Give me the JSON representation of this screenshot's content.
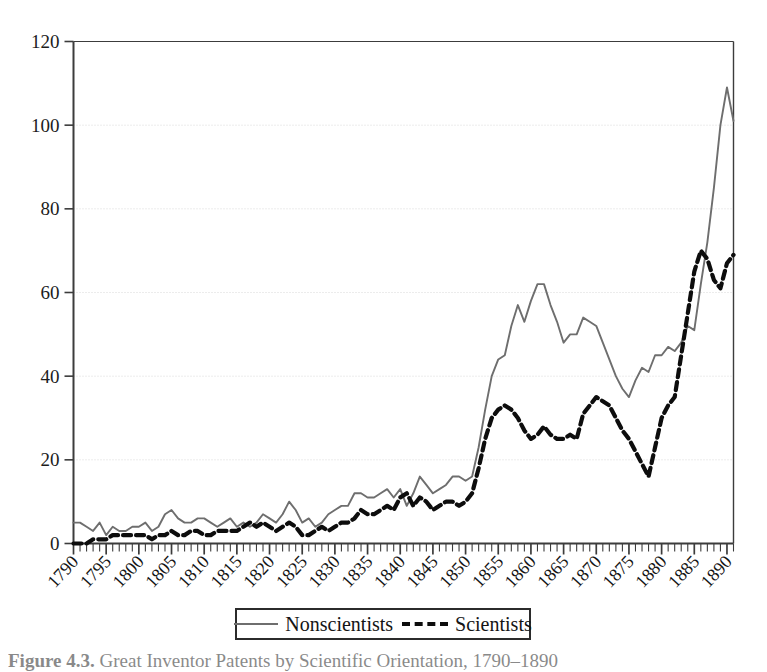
{
  "figure": {
    "caption_prefix": "Figure 4.3.",
    "caption_text": "Great Inventor Patents by Scientific Orientation, 1790–1890"
  },
  "legend": {
    "nonscientists_label": "Nonscientists",
    "scientists_label": "Scientists",
    "nonscientists_style": "solid",
    "scientists_style": "dashed"
  },
  "axes": {
    "y_ticks": [
      0,
      20,
      40,
      60,
      80,
      100,
      120
    ],
    "x_ticks": [
      1790,
      1795,
      1800,
      1805,
      1810,
      1815,
      1820,
      1825,
      1830,
      1835,
      1840,
      1845,
      1850,
      1855,
      1860,
      1865,
      1870,
      1875,
      1880,
      1885,
      1890
    ]
  },
  "colors": {
    "nonscientists": "#6e6e6e",
    "scientists": "#0d0d0d",
    "axis": "#3c3c3c",
    "gridline": "#d8d8d8",
    "background": "#ffffff"
  },
  "chart_data": {
    "type": "line",
    "title": "Great Inventor Patents by Scientific Orientation, 1790–1890",
    "xlabel": "",
    "ylabel": "",
    "xlim": [
      1790,
      1891
    ],
    "ylim": [
      0,
      120
    ],
    "grid": true,
    "legend_position": "bottom",
    "x": [
      1790,
      1791,
      1792,
      1793,
      1794,
      1795,
      1796,
      1797,
      1798,
      1799,
      1800,
      1801,
      1802,
      1803,
      1804,
      1805,
      1806,
      1807,
      1808,
      1809,
      1810,
      1811,
      1812,
      1813,
      1814,
      1815,
      1816,
      1817,
      1818,
      1819,
      1820,
      1821,
      1822,
      1823,
      1824,
      1825,
      1826,
      1827,
      1828,
      1829,
      1830,
      1831,
      1832,
      1833,
      1834,
      1835,
      1836,
      1837,
      1838,
      1839,
      1840,
      1841,
      1842,
      1843,
      1844,
      1845,
      1846,
      1847,
      1848,
      1849,
      1850,
      1851,
      1852,
      1853,
      1854,
      1855,
      1856,
      1857,
      1858,
      1859,
      1860,
      1861,
      1862,
      1863,
      1864,
      1865,
      1866,
      1867,
      1868,
      1869,
      1870,
      1871,
      1872,
      1873,
      1874,
      1875,
      1876,
      1877,
      1878,
      1879,
      1880,
      1881,
      1882,
      1883,
      1884,
      1885,
      1886,
      1887,
      1888,
      1889,
      1890,
      1891
    ],
    "series": [
      {
        "name": "Nonscientists",
        "style": "solid",
        "color": "#6e6e6e",
        "values": [
          5,
          5,
          4,
          3,
          5,
          2,
          4,
          3,
          3,
          4,
          4,
          5,
          3,
          4,
          7,
          8,
          6,
          5,
          5,
          6,
          6,
          5,
          4,
          5,
          6,
          4,
          5,
          4,
          5,
          7,
          6,
          5,
          7,
          10,
          8,
          5,
          6,
          4,
          5,
          7,
          8,
          9,
          9,
          12,
          12,
          11,
          11,
          12,
          13,
          11,
          13,
          9,
          12,
          16,
          14,
          12,
          13,
          14,
          16,
          16,
          15,
          16,
          23,
          32,
          40,
          44,
          45,
          52,
          57,
          53,
          58,
          62,
          62,
          57,
          53,
          48,
          50,
          50,
          54,
          53,
          52,
          48,
          44,
          40,
          37,
          35,
          39,
          42,
          41,
          45,
          45,
          47,
          46,
          48,
          52,
          51,
          62,
          72,
          85,
          100,
          109,
          101
        ]
      },
      {
        "name": "Scientists",
        "style": "dashed",
        "color": "#0d0d0d",
        "values": [
          0,
          0,
          0,
          1,
          1,
          1,
          2,
          2,
          2,
          2,
          2,
          2,
          1,
          2,
          2,
          3,
          2,
          2,
          3,
          3,
          2,
          2,
          3,
          3,
          3,
          3,
          4,
          5,
          4,
          5,
          4,
          3,
          4,
          5,
          4,
          2,
          2,
          3,
          4,
          3,
          4,
          5,
          5,
          6,
          8,
          7,
          7,
          8,
          9,
          8,
          11,
          12,
          9,
          11,
          10,
          8,
          9,
          10,
          10,
          9,
          10,
          12,
          18,
          25,
          30,
          32,
          33,
          32,
          30,
          27,
          25,
          26,
          28,
          26,
          25,
          25,
          26,
          25,
          31,
          33,
          35,
          34,
          33,
          30,
          27,
          25,
          22,
          19,
          16,
          23,
          30,
          33,
          35,
          45,
          55,
          65,
          70,
          68,
          63,
          61,
          67,
          69
        ]
      }
    ]
  }
}
